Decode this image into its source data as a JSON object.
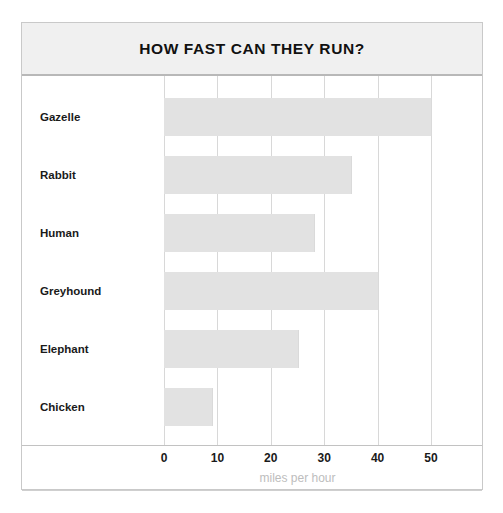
{
  "chart_data": {
    "type": "bar",
    "orientation": "horizontal",
    "title": "HOW FAST CAN THEY RUN?",
    "categories": [
      "Gazelle",
      "Rabbit",
      "Human",
      "Greyhound",
      "Elephant",
      "Chicken"
    ],
    "values": [
      50,
      35,
      28,
      40,
      25,
      9
    ],
    "xlabel": "miles per hour",
    "ylabel": "",
    "xticks": [
      0,
      10,
      20,
      30,
      40,
      50
    ],
    "xlim": [
      0,
      52
    ],
    "grid": "vertical",
    "legend": "none",
    "series": [
      {
        "name": "Top speed",
        "values": [
          50,
          35,
          28,
          40,
          25,
          9
        ]
      }
    ]
  },
  "colors": {
    "bar_fill": "#e2e2e2",
    "gridline": "#d8d8d8",
    "title_band": "#f0f0f0",
    "frame_border": "#c9c9c9",
    "tick_text": "#1a1a1a",
    "axis_title_text": "#bdbdbd"
  }
}
